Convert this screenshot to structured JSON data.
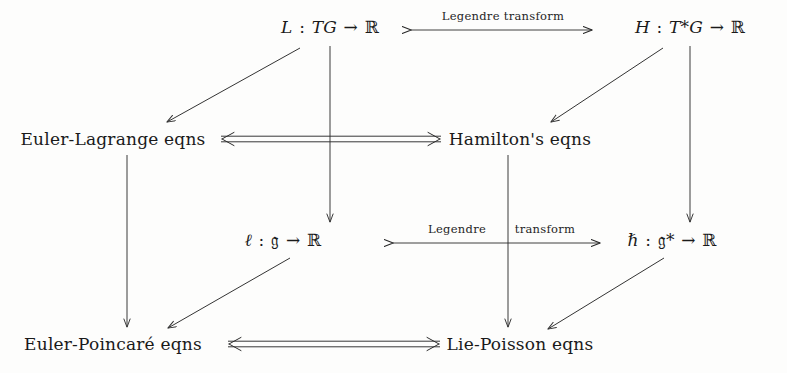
{
  "figure": {
    "background_color": "#fdfdfc",
    "ink_color": "#1a1a1a"
  },
  "nodes": {
    "lagrangian": {
      "id": "lagrangian",
      "text": "L : TG → ℝ",
      "symbol": "L",
      "domain": "TG",
      "codomain": "ℝ",
      "x": 330,
      "y": 27
    },
    "hamiltonian": {
      "id": "hamiltonian",
      "text": "H : T*G → ℝ",
      "symbol": "H",
      "domain": "T*G",
      "codomain": "ℝ",
      "x": 690,
      "y": 27
    },
    "euler_lagrange": {
      "id": "euler_lagrange",
      "text": "Euler-Lagrange eqns",
      "x": 113,
      "y": 139
    },
    "hamilton": {
      "id": "hamilton",
      "text": "Hamilton's eqns",
      "x": 520,
      "y": 139
    },
    "reduced_lagrangian": {
      "id": "reduced_lagrangian",
      "text": "ℓ : 𝔤 → ℝ",
      "symbol": "ℓ",
      "domain": "𝔤",
      "codomain": "ℝ",
      "x": 283,
      "y": 240
    },
    "reduced_hamiltonian": {
      "id": "reduced_hamiltonian",
      "text": "ℏ : 𝔤* → ℝ",
      "symbol": "ℏ",
      "domain": "𝔤*",
      "codomain": "ℝ",
      "x": 672,
      "y": 240
    },
    "euler_poincare": {
      "id": "euler_poincare",
      "text": "Euler-Poincaré eqns",
      "x": 113,
      "y": 344
    },
    "lie_poisson": {
      "id": "lie_poisson",
      "text": "Lie-Poisson eqns",
      "x": 520,
      "y": 344
    }
  },
  "edge_labels": {
    "legendre_transform_top": {
      "text": "Legendre transform",
      "x": 503,
      "y": 16
    },
    "legendre_bottom_left": {
      "text": "Legendre",
      "x": 457,
      "y": 229
    },
    "transform_bottom_right": {
      "text": "transform",
      "x": 545,
      "y": 229
    }
  },
  "edges": [
    {
      "id": "legendre-top",
      "from": "lagrangian",
      "to": "hamiltonian",
      "style": "bidirectional",
      "label": "Legendre transform"
    },
    {
      "id": "legendre-bottom",
      "from": "reduced_lagrangian",
      "to": "reduced_hamiltonian",
      "style": "bidirectional",
      "label": "Legendre transform"
    },
    {
      "id": "lagrangian-to-euler-lagrange",
      "from": "lagrangian",
      "to": "euler_lagrange",
      "style": "diagonal-arrow"
    },
    {
      "id": "hamiltonian-to-hamilton",
      "from": "hamiltonian",
      "to": "hamilton",
      "style": "diagonal-arrow"
    },
    {
      "id": "reduced-lagrangian-to-euler-poincare",
      "from": "reduced_lagrangian",
      "to": "euler_poincare",
      "style": "diagonal-arrow"
    },
    {
      "id": "reduced-hamiltonian-to-lie-poisson",
      "from": "reduced_hamiltonian",
      "to": "lie_poisson",
      "style": "diagonal-arrow"
    },
    {
      "id": "lagrangian-to-reduced-lagrangian",
      "from": "lagrangian",
      "to": "reduced_lagrangian",
      "style": "vertical-arrow"
    },
    {
      "id": "hamiltonian-to-reduced-hamiltonian",
      "from": "hamiltonian",
      "to": "reduced_hamiltonian",
      "style": "vertical-arrow"
    },
    {
      "id": "euler-lagrange-to-euler-poincare",
      "from": "euler_lagrange",
      "to": "euler_poincare",
      "style": "vertical-arrow"
    },
    {
      "id": "hamilton-to-lie-poisson",
      "from": "hamilton",
      "to": "lie_poisson",
      "style": "vertical-arrow"
    },
    {
      "id": "euler-lagrange-hamilton-equiv",
      "from": "euler_lagrange",
      "to": "hamilton",
      "style": "double-bidirectional"
    },
    {
      "id": "euler-poincare-lie-poisson-equiv",
      "from": "euler_poincare",
      "to": "lie_poisson",
      "style": "double-bidirectional"
    }
  ]
}
